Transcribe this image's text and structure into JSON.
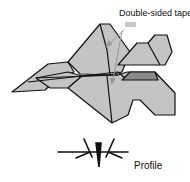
{
  "diagram": {
    "labels": {
      "tape": "Double-sided tape",
      "profile": "Profile"
    },
    "colors": {
      "panel_fill": "#c4c4c4",
      "dark_panel_fill": "#8a8a8a",
      "tape_fill": "#c8c8c8",
      "outline": "#111111",
      "arrow": "#999999"
    }
  }
}
